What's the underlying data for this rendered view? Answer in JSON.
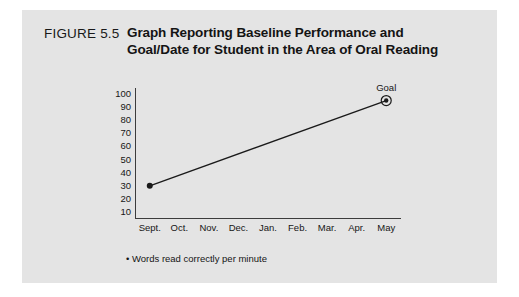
{
  "figure": {
    "number_label": "FIGURE 5.5",
    "title_line_1": "Graph Reporting Baseline Performance and",
    "title_line_2": "Goal/Date for Student in the Area of Oral Reading",
    "footnote": "• Words read correctly per minute",
    "panel_color": "#e4e4e4",
    "page_color": "#ffffff",
    "ink_color": "#161616"
  },
  "chart_data": {
    "type": "line",
    "title": "Graph Reporting Baseline Performance and Goal/Date for Student in the Area of Oral Reading",
    "xlabel": "",
    "ylabel": "",
    "categories": [
      "Sept.",
      "Oct.",
      "Nov.",
      "Dec.",
      "Jan.",
      "Feb.",
      "Mar.",
      "Apr.",
      "May"
    ],
    "yticks": [
      100,
      90,
      80,
      70,
      60,
      50,
      40,
      30,
      20,
      10
    ],
    "ylim": [
      0,
      105
    ],
    "grid": false,
    "legend": false,
    "series": [
      {
        "name": "Words read correctly per minute",
        "points": [
          {
            "x": "Sept.",
            "y": 30,
            "marker": "filled-dot",
            "label": ""
          },
          {
            "x": "May",
            "y": 95,
            "marker": "target-dot",
            "label": "Goal"
          }
        ]
      }
    ],
    "annotations": [
      {
        "text": "Goal",
        "x": "May",
        "y": 95
      }
    ],
    "footnote": "• Words read correctly per minute",
    "line_color": "#1a1a1a",
    "axis_color": "#3c3c3c"
  }
}
